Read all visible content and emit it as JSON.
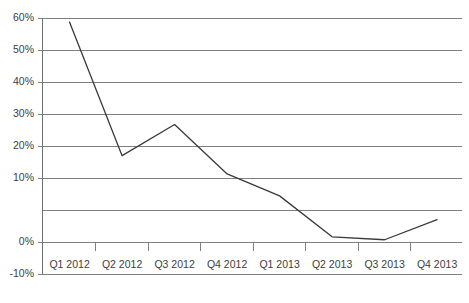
{
  "chart_data": {
    "type": "line",
    "title": "",
    "subtitle": "",
    "xlabel": "",
    "ylabel": "",
    "categories": [
      "Q1 2012",
      "Q2 2012",
      "Q3 2012",
      "Q4 2012",
      "Q1 2013",
      "Q2 2013",
      "Q3 2013",
      "Q4 2013"
    ],
    "values": [
      59,
      22.5,
      31,
      17.5,
      11.5,
      0.3,
      -0.5,
      5
    ],
    "series": [
      {
        "name": "Growth rate",
        "values": [
          59,
          22.5,
          31,
          17.5,
          11.5,
          0.3,
          -0.5,
          5
        ]
      }
    ],
    "ylim": [
      -10,
      60
    ],
    "ytick_values": [
      60,
      50,
      40,
      30,
      20,
      10,
      0,
      -10
    ],
    "ytick_labels": [
      "60%",
      "50%",
      "40%",
      "30%",
      "20%",
      "10%",
      "0%",
      "-10%"
    ],
    "xtick_labels": [
      "Q1 2012",
      "Q2 2012",
      "Q3 2012",
      "Q4 2012",
      "Q1 2013",
      "Q2 2013",
      "Q3 2013",
      "Q4 2013"
    ],
    "grid": true,
    "grid_axis": "y",
    "legend": false,
    "legend_position": "none",
    "annotations": [],
    "colors": {
      "line": "#3a3a3a",
      "grid": "#808080",
      "axis": "#6e6e6e",
      "tick_label": "#3d3d3d",
      "background": "#ffffff"
    }
  },
  "axes": {
    "y_labels": [
      {
        "text": "60%"
      },
      {
        "text": "50%"
      },
      {
        "text": "40%"
      },
      {
        "text": "30%"
      },
      {
        "text": "20%"
      },
      {
        "text": "10%"
      },
      {
        "text": "0%"
      },
      {
        "text": "-10%"
      }
    ],
    "x_labels": [
      {
        "text": "Q1 2012"
      },
      {
        "text": "Q2 2012"
      },
      {
        "text": "Q3 2012"
      },
      {
        "text": "Q4 2012"
      },
      {
        "text": "Q1 2013"
      },
      {
        "text": "Q2 2013"
      },
      {
        "text": "Q3 2013"
      },
      {
        "text": "Q4 2013"
      }
    ]
  }
}
